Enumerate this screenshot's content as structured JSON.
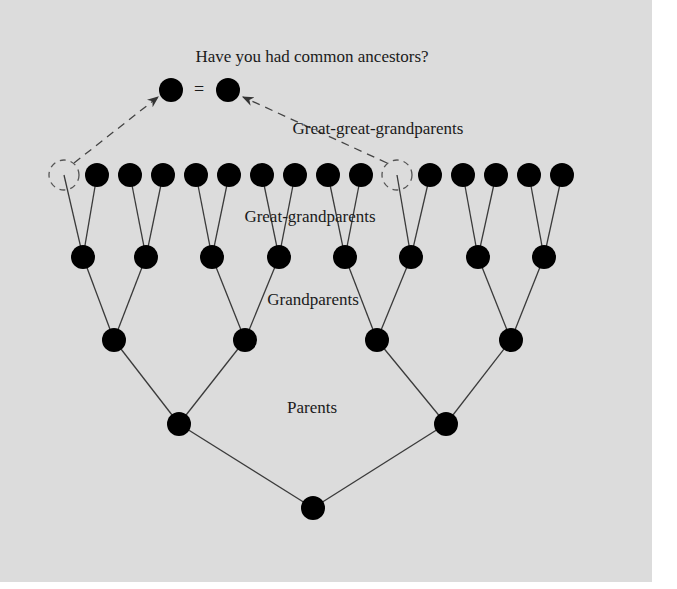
{
  "title": "Have you had common ancestors?",
  "equals_sign": "=",
  "labels": {
    "great_great_grandparents": "Great-great-grandparents",
    "great_grandparents": "Great-grandparents",
    "grandparents": "Grandparents",
    "parents": "Parents"
  },
  "colors": {
    "background": "#dcdcdc",
    "node": "#000000",
    "line": "#3a3a3a",
    "dashed": "#555555"
  },
  "tree": {
    "common_ancestors": [
      {
        "x": 171,
        "y": 90
      },
      {
        "x": 228,
        "y": 90
      }
    ],
    "great_great_grandparents": {
      "y": 175,
      "nodes": [
        {
          "x": 64,
          "dashed": true
        },
        {
          "x": 97
        },
        {
          "x": 130
        },
        {
          "x": 163
        },
        {
          "x": 196
        },
        {
          "x": 229
        },
        {
          "x": 262
        },
        {
          "x": 295
        },
        {
          "x": 328
        },
        {
          "x": 361
        },
        {
          "x": 397,
          "dashed": true
        },
        {
          "x": 430
        },
        {
          "x": 463
        },
        {
          "x": 496
        },
        {
          "x": 529
        },
        {
          "x": 562
        }
      ]
    },
    "great_grandparents": {
      "y": 257,
      "xs": [
        83,
        146,
        212,
        279,
        345,
        411,
        478,
        544
      ]
    },
    "grandparents": {
      "y": 340,
      "xs": [
        114,
        245,
        377,
        511
      ]
    },
    "parents": {
      "y": 424,
      "xs": [
        179,
        446
      ]
    },
    "self": {
      "x": 313,
      "y": 508
    }
  }
}
